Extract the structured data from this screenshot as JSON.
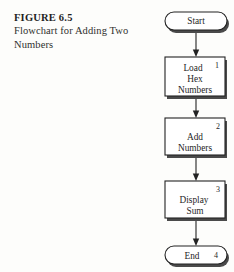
{
  "figure": {
    "label": "FIGURE 6.5",
    "description_line1": "Flowchart for Adding Two",
    "description_line2": "Numbers"
  },
  "colors": {
    "ink": "#232323",
    "paper": "#fdfdfb",
    "shadow": "#4a4a4a"
  },
  "flowchart": {
    "type": "flowchart",
    "orientation": "vertical",
    "nodes": [
      {
        "id": "start",
        "shape": "terminator",
        "step": "",
        "lines": [
          "Start"
        ]
      },
      {
        "id": "load",
        "shape": "process",
        "step": "1",
        "lines": [
          "Load",
          "Hex",
          "Numbers"
        ]
      },
      {
        "id": "add",
        "shape": "process",
        "step": "2",
        "lines": [
          "Add",
          "Numbers"
        ]
      },
      {
        "id": "display",
        "shape": "process",
        "step": "3",
        "lines": [
          "Display",
          "Sum"
        ]
      },
      {
        "id": "end",
        "shape": "terminator",
        "step": "4",
        "lines": [
          "End"
        ]
      }
    ],
    "edges": [
      {
        "from": "start",
        "to": "load",
        "arrow": "down"
      },
      {
        "from": "load",
        "to": "add",
        "arrow": "down"
      },
      {
        "from": "add",
        "to": "display",
        "arrow": "down"
      },
      {
        "from": "display",
        "to": "end",
        "arrow": "down"
      }
    ]
  }
}
